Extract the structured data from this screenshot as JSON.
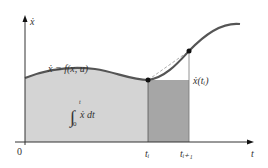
{
  "diagram": {
    "y_axis_label": "ẋ",
    "x_axis_label": "t",
    "origin_label": "0",
    "curve_label": "ẋ = f(x, u)",
    "integral_label": {
      "symbol": "∫",
      "upper": "t",
      "lower": "0",
      "integrand": "ẋ dt"
    },
    "point_label": "ẋ(tᵢ)",
    "tick_labels": {
      "t_i": "tᵢ",
      "t_i1": "tᵢ₊₁"
    }
  },
  "colors": {
    "curve": "#555555",
    "area_light": "#d4d4d4",
    "area_dark": "#a6a6a6",
    "axis": "#333333",
    "points": "#111111"
  }
}
